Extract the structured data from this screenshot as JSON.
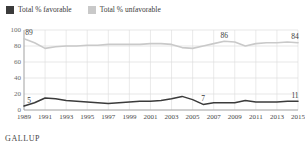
{
  "legend": {
    "items": [
      {
        "label": "Total % favorable",
        "color": "#3b3b3b",
        "swatch_icon": "legend-swatch-icon"
      },
      {
        "label": "Total % unfavorable",
        "color": "#c9c9c9",
        "swatch_icon": "legend-swatch-icon"
      }
    ]
  },
  "footer": {
    "brand": "GALLUP"
  },
  "chart_data": {
    "type": "line",
    "title": "",
    "subtitle": "",
    "xlabel": "",
    "ylabel": "",
    "xlim": [
      1989,
      2015
    ],
    "ylim": [
      0,
      100
    ],
    "yticks": [
      0,
      20,
      40,
      60,
      80,
      100
    ],
    "ytick_labels": [
      "0",
      "20",
      "40",
      "60",
      "80",
      "100"
    ],
    "xticks": [
      1989,
      1991,
      1993,
      1995,
      1997,
      1999,
      2001,
      2003,
      2005,
      2007,
      2009,
      2011,
      2013,
      2015
    ],
    "xtick_labels": [
      "1989",
      "1991",
      "1993",
      "1995",
      "1997",
      "1999",
      "2001",
      "2003",
      "2005",
      "2007",
      "2009",
      "2011",
      "2013",
      "2015"
    ],
    "grid": "horizontal-and-vertical",
    "legend_position": "top-left",
    "series": [
      {
        "name": "Total % unfavorable",
        "color": "#c9c9c9",
        "x": [
          1989,
          1990,
          1991,
          1992,
          1993,
          1994,
          1995,
          1996,
          1997,
          1998,
          1999,
          2000,
          2001,
          2002,
          2003,
          2004,
          2005,
          2006,
          2007,
          2008,
          2009,
          2010,
          2011,
          2012,
          2013,
          2014,
          2015
        ],
        "values": [
          89,
          84,
          77,
          79,
          80,
          80,
          81,
          81,
          82,
          82,
          82,
          82,
          83,
          83,
          82,
          78,
          77,
          80,
          83,
          86,
          85,
          80,
          83,
          84,
          84,
          85,
          84
        ]
      },
      {
        "name": "Total % favorable",
        "color": "#3b3b3b",
        "x": [
          1989,
          1990,
          1991,
          1992,
          1993,
          1994,
          1995,
          1996,
          1997,
          1998,
          1999,
          2000,
          2001,
          2002,
          2003,
          2004,
          2005,
          2006,
          2007,
          2008,
          2009,
          2010,
          2011,
          2012,
          2013,
          2014,
          2015
        ],
        "values": [
          5,
          9,
          15,
          14,
          12,
          11,
          10,
          9,
          8,
          9,
          10,
          11,
          11,
          12,
          14,
          17,
          13,
          7,
          9,
          9,
          9,
          12,
          10,
          10,
          10,
          11,
          11
        ]
      }
    ],
    "annotations": [
      {
        "text": "89",
        "x": 1989,
        "y": 89,
        "series": "Total % unfavorable",
        "position": "above"
      },
      {
        "text": "86",
        "x": 2008,
        "y": 86,
        "series": "Total % unfavorable",
        "position": "above"
      },
      {
        "text": "84",
        "x": 2015,
        "y": 84,
        "series": "Total % unfavorable",
        "position": "above"
      },
      {
        "text": "5",
        "x": 1989,
        "y": 5,
        "series": "Total % favorable",
        "position": "above"
      },
      {
        "text": "7",
        "x": 2006,
        "y": 7,
        "series": "Total % favorable",
        "position": "above"
      },
      {
        "text": "11",
        "x": 2015,
        "y": 11,
        "series": "Total % favorable",
        "position": "above"
      }
    ]
  }
}
